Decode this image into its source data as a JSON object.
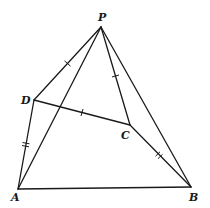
{
  "diagram": {
    "type": "geometry-pyramid",
    "stroke_color": "#1a1a1a",
    "background": "#ffffff",
    "vertices": {
      "P": {
        "label": "P",
        "x": 101,
        "y": 27
      },
      "D": {
        "label": "D",
        "x": 34,
        "y": 100
      },
      "C": {
        "label": "C",
        "x": 130,
        "y": 125
      },
      "A": {
        "label": "A",
        "x": 18,
        "y": 189
      },
      "B": {
        "label": "B",
        "x": 191,
        "y": 187
      }
    },
    "labels": {
      "P": "P",
      "D": "D",
      "C": "C",
      "A": "A",
      "B": "B"
    },
    "edges": [
      {
        "from": "P",
        "to": "D",
        "ticks": 1
      },
      {
        "from": "P",
        "to": "A",
        "ticks": 0
      },
      {
        "from": "P",
        "to": "C",
        "ticks": 1
      },
      {
        "from": "P",
        "to": "B",
        "ticks": 0
      },
      {
        "from": "D",
        "to": "C",
        "ticks": 1
      },
      {
        "from": "D",
        "to": "A",
        "ticks": 2
      },
      {
        "from": "C",
        "to": "B",
        "ticks": 2
      },
      {
        "from": "A",
        "to": "B",
        "ticks": 0
      }
    ]
  }
}
